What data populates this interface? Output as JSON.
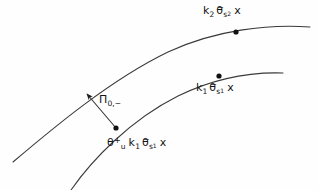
{
  "figure": {
    "background_color": "#fefefe",
    "stroke_color": "#3a3a3a",
    "marker_color": "#111111"
  },
  "labels": {
    "top_point": {
      "name": "k2-theta-bar-s2-x",
      "k": "k",
      "k_sub": "2",
      "theta": "θ",
      "theta_bar": "−",
      "theta_sub": "s",
      "theta_subsub": "2",
      "x": "x"
    },
    "mid_point": {
      "name": "k1-theta-bar-s1-x",
      "k": "k",
      "k_sub": "1",
      "theta": "θ",
      "theta_bar": "−",
      "theta_sub": "s",
      "theta_subsub": "1",
      "x": "x"
    },
    "bottom_point": {
      "name": "theta-u-plus-k1-theta-bar-s1-x",
      "theta_u": "θ",
      "theta_u_sup": "+",
      "theta_u_sub": "u",
      "k": "k",
      "k_sub": "1",
      "theta": "θ",
      "theta_bar": "−",
      "theta_sub": "s",
      "theta_subsub": "1",
      "x": "x"
    },
    "projection": {
      "name": "pi-0-minus",
      "pi": "Π",
      "sub": "0,−"
    }
  },
  "geometry": {
    "upper_curve": "M 13 162 C 52 129, 110 80, 168 52 C 215 30, 268 24, 310 27",
    "lower_curve": "M 71 190 C 92 160, 130 120, 178 96 C 215 78, 252 72, 283 73",
    "connector": "M 116 128 L 87 94",
    "arrow_tip": {
      "x": 86,
      "y": 93
    },
    "points": [
      {
        "name": "top-marker",
        "x": 236,
        "y": 32,
        "r": 2.6
      },
      {
        "name": "mid-marker",
        "x": 219,
        "y": 76,
        "r": 2.6
      },
      {
        "name": "bottom-marker",
        "x": 116,
        "y": 128,
        "r": 2.6
      }
    ]
  }
}
